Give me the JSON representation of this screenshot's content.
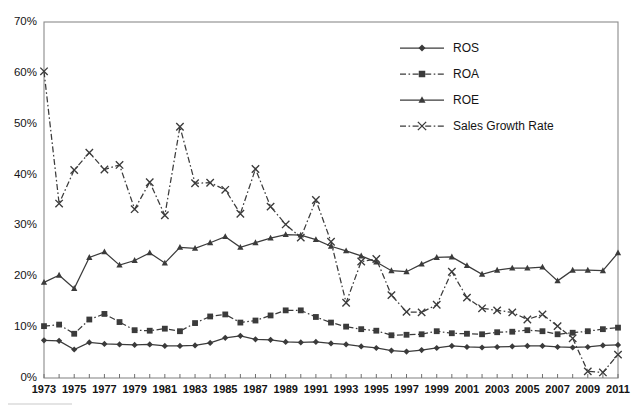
{
  "chart_data": {
    "type": "line",
    "title": "",
    "subtitle": "",
    "xlabel": "",
    "ylabel": "",
    "xlim": [
      1973,
      2011
    ],
    "ylim": [
      0,
      0.7
    ],
    "grid": false,
    "legend_position": "top-right",
    "y_tick_labels": [
      "0%",
      "10%",
      "20%",
      "30%",
      "40%",
      "50%",
      "60%",
      "70%"
    ],
    "y_tick_values": [
      0,
      10,
      20,
      30,
      40,
      50,
      60,
      70
    ],
    "x_tick_labels": [
      "1973",
      "1975",
      "1977",
      "1979",
      "1981",
      "1983",
      "1985",
      "1987",
      "1989",
      "1991",
      "1993",
      "1995",
      "1997",
      "1999",
      "2001",
      "2003",
      "2005",
      "2007",
      "2009",
      "2011"
    ],
    "x": [
      1973,
      1974,
      1975,
      1976,
      1977,
      1978,
      1979,
      1980,
      1981,
      1982,
      1983,
      1984,
      1985,
      1986,
      1987,
      1988,
      1989,
      1990,
      1991,
      1992,
      1993,
      1994,
      1995,
      1996,
      1997,
      1998,
      1999,
      2000,
      2001,
      2002,
      2003,
      2004,
      2005,
      2006,
      2007,
      2008,
      2009,
      2010,
      2011
    ],
    "series": [
      {
        "name": "ROS",
        "marker": "diamond",
        "line_style": "solid",
        "values": [
          7.4,
          7.3,
          5.6,
          7.0,
          6.7,
          6.6,
          6.5,
          6.6,
          6.3,
          6.3,
          6.4,
          6.9,
          7.9,
          8.3,
          7.6,
          7.5,
          7.1,
          7.0,
          7.1,
          6.8,
          6.6,
          6.2,
          5.9,
          5.4,
          5.2,
          5.5,
          5.9,
          6.3,
          6.1,
          6.0,
          6.1,
          6.2,
          6.3,
          6.3,
          6.1,
          6.0,
          6.1,
          6.4,
          6.5
        ]
      },
      {
        "name": "ROA",
        "marker": "square",
        "line_style": "dashdot",
        "values": [
          10.2,
          10.5,
          8.7,
          11.5,
          12.6,
          11.0,
          9.4,
          9.3,
          9.7,
          9.2,
          10.8,
          12.1,
          12.5,
          10.9,
          11.3,
          12.3,
          13.3,
          13.3,
          12.0,
          10.9,
          10.1,
          9.6,
          9.3,
          8.4,
          8.5,
          8.6,
          9.2,
          8.8,
          8.7,
          8.6,
          9.0,
          9.1,
          9.4,
          9.2,
          8.6,
          8.9,
          9.2,
          9.6,
          9.9
        ]
      },
      {
        "name": "ROE",
        "marker": "triangle",
        "line_style": "solid",
        "values": [
          18.8,
          20.2,
          17.6,
          23.7,
          24.8,
          22.2,
          23.1,
          24.6,
          22.6,
          25.7,
          25.5,
          26.6,
          27.8,
          25.7,
          26.6,
          27.5,
          28.2,
          28.1,
          27.2,
          25.9,
          25.0,
          24.0,
          22.8,
          21.1,
          20.9,
          22.4,
          23.7,
          23.8,
          22.1,
          20.4,
          21.2,
          21.6,
          21.6,
          21.8,
          19.1,
          21.2,
          21.2,
          21.1,
          24.6
        ]
      },
      {
        "name": "Sales Growth Rate",
        "marker": "cross",
        "line_style": "dashdot",
        "values": [
          60.3,
          34.3,
          40.9,
          44.3,
          41.0,
          41.9,
          33.2,
          38.5,
          32.0,
          49.4,
          38.3,
          38.4,
          37.0,
          32.3,
          41.1,
          33.7,
          30.2,
          27.6,
          35.0,
          26.8,
          14.8,
          22.9,
          23.4,
          16.3,
          13.0,
          12.9,
          14.4,
          20.9,
          15.8,
          13.7,
          13.3,
          12.9,
          11.5,
          12.5,
          10.2,
          7.8,
          1.3,
          1.1,
          4.6
        ]
      }
    ]
  },
  "legend": {
    "items": [
      {
        "label": "ROS",
        "marker": "diamond"
      },
      {
        "label": "ROA",
        "marker": "square"
      },
      {
        "label": "ROE",
        "marker": "triangle"
      },
      {
        "label": "Sales Growth Rate",
        "marker": "cross"
      }
    ]
  }
}
